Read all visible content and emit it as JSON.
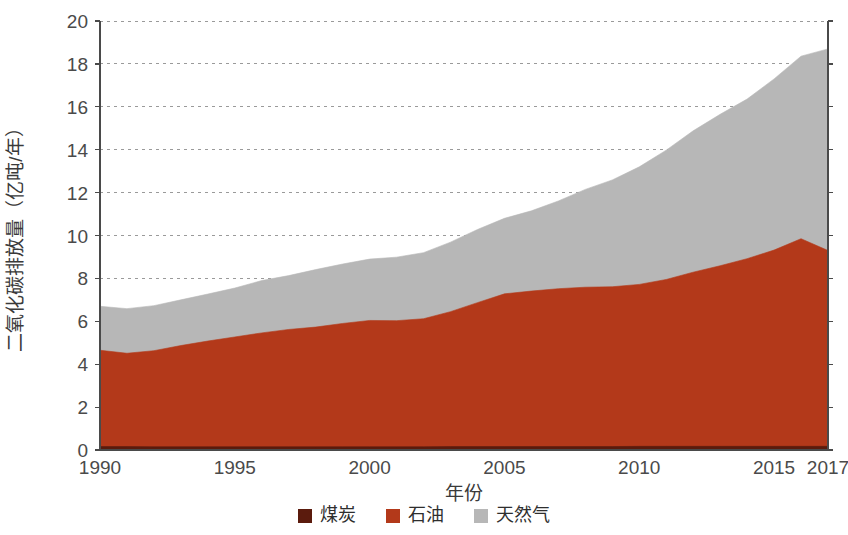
{
  "chart_data": {
    "type": "area",
    "stacked": true,
    "title": "",
    "xlabel": "年份",
    "ylabel": "二氧化碳排放量（亿吨/年）",
    "xlim": [
      1990,
      2017
    ],
    "ylim": [
      0,
      20
    ],
    "ytick_step": 2,
    "grid": "horizontal-dashed",
    "legend_position": "bottom",
    "xtick_labels": [
      "1990",
      "1995",
      "2000",
      "2005",
      "2010",
      "2015",
      "2017"
    ],
    "xtick_values": [
      1990,
      1995,
      2000,
      2005,
      2010,
      2015,
      2017
    ],
    "ytick_labels": [
      "0",
      "2",
      "4",
      "6",
      "8",
      "10",
      "12",
      "14",
      "16",
      "18",
      "20"
    ],
    "ytick_values": [
      0,
      2,
      4,
      6,
      8,
      10,
      12,
      14,
      16,
      18,
      20
    ],
    "x": [
      1990,
      1991,
      1992,
      1993,
      1994,
      1995,
      1996,
      1997,
      1998,
      1999,
      2000,
      2001,
      2002,
      2003,
      2004,
      2005,
      2006,
      2007,
      2008,
      2009,
      2010,
      2011,
      2012,
      2013,
      2014,
      2015,
      2016,
      2017
    ],
    "series": [
      {
        "name": "煤炭",
        "color": "#5b1b0d",
        "values": [
          0.16,
          0.16,
          0.15,
          0.15,
          0.15,
          0.15,
          0.15,
          0.15,
          0.15,
          0.15,
          0.15,
          0.15,
          0.15,
          0.16,
          0.16,
          0.16,
          0.16,
          0.16,
          0.16,
          0.16,
          0.17,
          0.17,
          0.17,
          0.17,
          0.17,
          0.17,
          0.17,
          0.17
        ]
      },
      {
        "name": "石油",
        "color": "#b3391a",
        "values": [
          4.49,
          4.35,
          4.48,
          4.72,
          4.93,
          5.12,
          5.31,
          5.47,
          5.58,
          5.75,
          5.89,
          5.88,
          5.97,
          6.29,
          6.71,
          7.12,
          7.25,
          7.36,
          7.43,
          7.45,
          7.55,
          7.78,
          8.12,
          8.42,
          8.75,
          9.15,
          9.68,
          9.13
        ]
      },
      {
        "name": "天然气",
        "color": "#b7b7b7",
        "values": [
          2.05,
          2.08,
          2.1,
          2.13,
          2.19,
          2.28,
          2.44,
          2.51,
          2.68,
          2.77,
          2.86,
          2.96,
          3.08,
          3.24,
          3.41,
          3.52,
          3.74,
          4.09,
          4.56,
          4.98,
          5.48,
          6.03,
          6.59,
          7.06,
          7.44,
          7.98,
          8.51,
          9.4
        ]
      }
    ],
    "totals": [
      6.7,
      6.59,
      6.73,
      7.0,
      7.27,
      7.55,
      7.9,
      8.13,
      8.41,
      8.67,
      8.9,
      8.99,
      9.2,
      9.69,
      10.28,
      10.8,
      11.15,
      11.61,
      12.15,
      12.59,
      13.2,
      13.98,
      14.88,
      15.65,
      16.36,
      17.3,
      18.36,
      18.7
    ]
  },
  "legend": {
    "items": [
      {
        "label": "煤炭",
        "color": "#5b1b0d"
      },
      {
        "label": "石油",
        "color": "#b3391a"
      },
      {
        "label": "天然气",
        "color": "#b7b7b7"
      }
    ]
  }
}
